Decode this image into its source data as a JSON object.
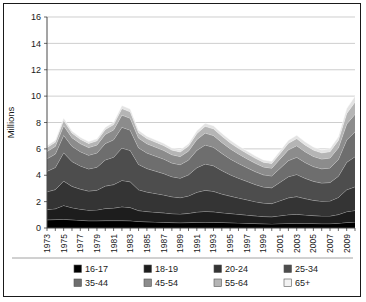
{
  "chart_data": {
    "type": "area",
    "stacked": true,
    "title": "",
    "xlabel": "",
    "ylabel": "Millions",
    "ylim": [
      0,
      16
    ],
    "yticks": [
      0,
      2,
      4,
      6,
      8,
      10,
      12,
      14,
      16
    ],
    "grid": true,
    "legend_position": "bottom",
    "x": [
      1973,
      1974,
      1975,
      1976,
      1977,
      1978,
      1979,
      1980,
      1981,
      1982,
      1983,
      1984,
      1985,
      1986,
      1987,
      1988,
      1989,
      1990,
      1991,
      1992,
      1993,
      1994,
      1995,
      1996,
      1997,
      1998,
      1999,
      2000,
      2001,
      2002,
      2003,
      2004,
      2005,
      2006,
      2007,
      2008,
      2009,
      2010
    ],
    "xtick_labels": [
      "1973",
      "1975",
      "1977",
      "1979",
      "1981",
      "1983",
      "1985",
      "1987",
      "1989",
      "1991",
      "1993",
      "1995",
      "1997",
      "1999",
      "2001",
      "2003",
      "2005",
      "2007",
      "2009"
    ],
    "series": [
      {
        "name": "16-17",
        "color": "#000000",
        "values": [
          0.62,
          0.64,
          0.66,
          0.62,
          0.58,
          0.55,
          0.55,
          0.56,
          0.56,
          0.56,
          0.55,
          0.5,
          0.47,
          0.45,
          0.43,
          0.41,
          0.4,
          0.41,
          0.43,
          0.44,
          0.43,
          0.42,
          0.4,
          0.38,
          0.36,
          0.34,
          0.32,
          0.31,
          0.33,
          0.35,
          0.36,
          0.35,
          0.34,
          0.33,
          0.33,
          0.36,
          0.42,
          0.45
        ]
      },
      {
        "name": "18-19",
        "color": "#1d1d1d",
        "values": [
          0.78,
          0.82,
          1.05,
          0.92,
          0.85,
          0.8,
          0.82,
          0.92,
          0.95,
          1.05,
          1.0,
          0.82,
          0.78,
          0.75,
          0.72,
          0.68,
          0.66,
          0.7,
          0.78,
          0.82,
          0.8,
          0.74,
          0.7,
          0.66,
          0.62,
          0.58,
          0.55,
          0.54,
          0.6,
          0.66,
          0.68,
          0.64,
          0.6,
          0.58,
          0.58,
          0.66,
          0.82,
          0.88
        ]
      },
      {
        "name": "20-24",
        "color": "#343434",
        "values": [
          1.35,
          1.45,
          1.85,
          1.62,
          1.52,
          1.45,
          1.5,
          1.7,
          1.78,
          2.0,
          1.95,
          1.58,
          1.48,
          1.42,
          1.36,
          1.28,
          1.24,
          1.32,
          1.5,
          1.6,
          1.55,
          1.42,
          1.32,
          1.24,
          1.16,
          1.08,
          1.02,
          1.0,
          1.14,
          1.28,
          1.34,
          1.24,
          1.16,
          1.12,
          1.14,
          1.3,
          1.66,
          1.8
        ]
      },
      {
        "name": "25-34",
        "color": "#4d4d4d",
        "values": [
          1.55,
          1.68,
          2.15,
          1.88,
          1.76,
          1.68,
          1.74,
          1.98,
          2.08,
          2.45,
          2.38,
          1.92,
          1.78,
          1.7,
          1.62,
          1.52,
          1.48,
          1.6,
          1.86,
          2.0,
          1.94,
          1.78,
          1.62,
          1.5,
          1.4,
          1.3,
          1.22,
          1.2,
          1.4,
          1.6,
          1.68,
          1.54,
          1.44,
          1.38,
          1.4,
          1.6,
          2.08,
          2.28
        ]
      },
      {
        "name": "35-44",
        "color": "#6e6e6e",
        "values": [
          0.95,
          1.02,
          1.32,
          1.16,
          1.08,
          1.04,
          1.08,
          1.24,
          1.32,
          1.58,
          1.54,
          1.26,
          1.18,
          1.14,
          1.1,
          1.04,
          1.02,
          1.12,
          1.32,
          1.44,
          1.4,
          1.3,
          1.2,
          1.12,
          1.04,
          0.98,
          0.92,
          0.9,
          1.06,
          1.22,
          1.3,
          1.2,
          1.12,
          1.08,
          1.1,
          1.28,
          1.7,
          1.88
        ]
      },
      {
        "name": "45-54",
        "color": "#8c8c8c",
        "values": [
          0.55,
          0.58,
          0.74,
          0.65,
          0.61,
          0.58,
          0.6,
          0.7,
          0.75,
          0.92,
          0.9,
          0.74,
          0.7,
          0.68,
          0.66,
          0.63,
          0.62,
          0.68,
          0.82,
          0.9,
          0.89,
          0.83,
          0.77,
          0.72,
          0.68,
          0.64,
          0.6,
          0.59,
          0.7,
          0.82,
          0.88,
          0.82,
          0.77,
          0.74,
          0.76,
          0.88,
          1.2,
          1.34
        ]
      },
      {
        "name": "55-64",
        "color": "#b5b5b5",
        "values": [
          0.3,
          0.32,
          0.4,
          0.35,
          0.33,
          0.31,
          0.32,
          0.37,
          0.4,
          0.5,
          0.49,
          0.41,
          0.39,
          0.38,
          0.37,
          0.35,
          0.35,
          0.38,
          0.46,
          0.51,
          0.51,
          0.48,
          0.45,
          0.42,
          0.4,
          0.38,
          0.36,
          0.35,
          0.42,
          0.5,
          0.54,
          0.51,
          0.48,
          0.47,
          0.48,
          0.57,
          0.8,
          0.92
        ]
      },
      {
        "name": "65+",
        "color": "#e3e3e3",
        "values": [
          0.14,
          0.15,
          0.18,
          0.16,
          0.15,
          0.14,
          0.15,
          0.17,
          0.18,
          0.23,
          0.22,
          0.19,
          0.18,
          0.17,
          0.17,
          0.16,
          0.16,
          0.17,
          0.21,
          0.23,
          0.23,
          0.22,
          0.21,
          0.2,
          0.19,
          0.18,
          0.17,
          0.17,
          0.2,
          0.23,
          0.25,
          0.24,
          0.23,
          0.22,
          0.23,
          0.27,
          0.38,
          0.45
        ]
      }
    ]
  },
  "legend": {
    "items": [
      {
        "label": "16-17",
        "color": "#000000"
      },
      {
        "label": "18-19",
        "color": "#1d1d1d"
      },
      {
        "label": "20-24",
        "color": "#343434"
      },
      {
        "label": "25-34",
        "color": "#4d4d4d"
      },
      {
        "label": "35-44",
        "color": "#6e6e6e"
      },
      {
        "label": "45-54",
        "color": "#8c8c8c"
      },
      {
        "label": "55-64",
        "color": "#b5b5b5"
      },
      {
        "label": "65+",
        "color": "#f2f2f2"
      }
    ]
  }
}
